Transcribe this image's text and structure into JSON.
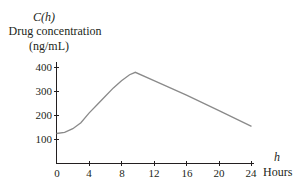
{
  "chart_data": {
    "type": "line",
    "title": "",
    "ylabel_symbol": "C(h)",
    "ylabel": "Drug concentration",
    "ylabel_units": "(ng/mL)",
    "xlabel_symbol": "h",
    "xlabel": "Hours",
    "xlim": [
      0,
      24
    ],
    "ylim": [
      0,
      400
    ],
    "x_ticks": [
      "0",
      "4",
      "8",
      "12",
      "16",
      "20",
      "24"
    ],
    "y_ticks": [
      "100",
      "200",
      "300",
      "400"
    ],
    "grid": false,
    "legend": null,
    "series": [
      {
        "name": "C(h)",
        "x": [
          0,
          1,
          2,
          3,
          4,
          5,
          6,
          7,
          8,
          9,
          9.7,
          12,
          16,
          20,
          24
        ],
        "values": [
          125,
          130,
          145,
          170,
          210,
          245,
          280,
          315,
          345,
          370,
          380,
          345,
          285,
          220,
          155
        ]
      }
    ],
    "color": "#8a8a8a",
    "axis_color": "#231f20"
  }
}
